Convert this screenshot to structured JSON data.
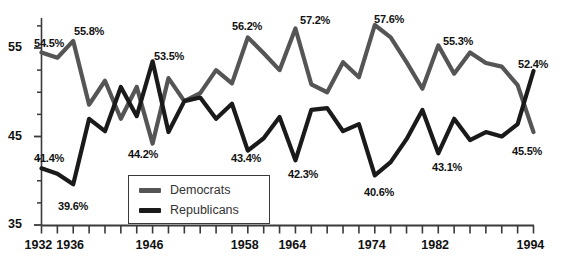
{
  "chart_data": {
    "type": "line",
    "title": "",
    "xlabel": "",
    "ylabel": "",
    "xlim": [
      1932,
      1994
    ],
    "ylim": [
      35,
      60
    ],
    "grid": false,
    "legend_position": "bottom-left",
    "y_ticks_major": [
      35,
      45,
      55
    ],
    "y_ticks_minor": [
      37.5,
      40,
      42.5,
      47.5,
      50,
      52.5,
      57.5
    ],
    "x_tick_labels": [
      "1932",
      "1936",
      "1946",
      "1958",
      "1964",
      "1974",
      "1982",
      "1994"
    ],
    "x_tick_years": [
      1932,
      1936,
      1946,
      1958,
      1964,
      1974,
      1982,
      1994
    ],
    "x_tick_step_years": 2,
    "colors": {
      "democrats": "#555555",
      "republicans": "#1a1a1a"
    },
    "series": [
      {
        "name": "Democrats",
        "color": "#555555",
        "x": [
          1932,
          1934,
          1936,
          1938,
          1940,
          1942,
          1944,
          1946,
          1948,
          1950,
          1952,
          1954,
          1956,
          1958,
          1960,
          1962,
          1964,
          1966,
          1968,
          1970,
          1972,
          1974,
          1976,
          1978,
          1980,
          1982,
          1984,
          1986,
          1988,
          1990,
          1992,
          1994
        ],
        "values": [
          54.5,
          53.9,
          55.8,
          48.6,
          51.3,
          47.0,
          50.6,
          44.2,
          51.6,
          49.0,
          49.9,
          52.5,
          51.0,
          56.2,
          54.4,
          52.5,
          57.2,
          50.9,
          50.0,
          53.4,
          51.7,
          57.6,
          56.2,
          53.4,
          50.4,
          55.3,
          52.1,
          54.5,
          53.3,
          52.9,
          50.8,
          45.5
        ]
      },
      {
        "name": "Republicans",
        "color": "#1a1a1a",
        "x": [
          1932,
          1934,
          1936,
          1938,
          1940,
          1942,
          1944,
          1946,
          1948,
          1950,
          1952,
          1954,
          1956,
          1958,
          1960,
          1962,
          1964,
          1966,
          1968,
          1970,
          1972,
          1974,
          1976,
          1978,
          1980,
          1982,
          1984,
          1986,
          1988,
          1990,
          1992,
          1994
        ],
        "values": [
          41.4,
          40.8,
          39.6,
          47.0,
          45.6,
          50.6,
          47.3,
          53.5,
          45.5,
          49.0,
          49.4,
          47.0,
          48.7,
          43.4,
          44.8,
          47.2,
          42.3,
          48.0,
          48.2,
          45.6,
          46.4,
          40.6,
          42.1,
          44.7,
          48.0,
          43.1,
          47.0,
          44.6,
          45.5,
          45.0,
          46.4,
          52.4
        ]
      }
    ],
    "annotations": [
      {
        "text": "54.5%",
        "series": "Democrats",
        "year": 1932,
        "value": 54.5,
        "x": 34,
        "y": 37
      },
      {
        "text": "55.8%",
        "series": "Democrats",
        "year": 1936,
        "value": 55.8,
        "x": 74,
        "y": 25
      },
      {
        "text": "53.5%",
        "series": "Republicans",
        "year": 1946,
        "value": 53.5,
        "x": 154,
        "y": 50
      },
      {
        "text": "56.2%",
        "series": "Democrats",
        "year": 1958,
        "value": 56.2,
        "x": 232,
        "y": 20
      },
      {
        "text": "57.2%",
        "series": "Democrats",
        "year": 1964,
        "value": 57.2,
        "x": 300,
        "y": 14
      },
      {
        "text": "57.6%",
        "series": "Democrats",
        "year": 1974,
        "value": 57.6,
        "x": 374,
        "y": 13
      },
      {
        "text": "55.3%",
        "series": "Democrats",
        "year": 1982,
        "value": 55.3,
        "x": 443,
        "y": 35
      },
      {
        "text": "52.4%",
        "series": "Republicans",
        "year": 1994,
        "value": 52.4,
        "x": 518,
        "y": 58
      },
      {
        "text": "41.4%",
        "series": "Republicans",
        "year": 1932,
        "value": 41.4,
        "x": 34,
        "y": 152
      },
      {
        "text": "39.6%",
        "series": "Republicans",
        "year": 1936,
        "value": 39.6,
        "x": 58,
        "y": 200
      },
      {
        "text": "44.2%",
        "series": "Democrats",
        "year": 1946,
        "value": 44.2,
        "x": 128,
        "y": 148
      },
      {
        "text": "43.4%",
        "series": "Republicans",
        "year": 1958,
        "value": 43.4,
        "x": 231,
        "y": 152
      },
      {
        "text": "42.3%",
        "series": "Republicans",
        "year": 1964,
        "value": 42.3,
        "x": 288,
        "y": 168
      },
      {
        "text": "40.6%",
        "series": "Republicans",
        "year": 1974,
        "value": 40.6,
        "x": 364,
        "y": 186
      },
      {
        "text": "43.1%",
        "series": "Republicans",
        "year": 1982,
        "value": 43.1,
        "x": 432,
        "y": 161
      },
      {
        "text": "45.5%",
        "series": "Democrats",
        "year": 1994,
        "value": 45.5,
        "x": 512,
        "y": 145
      }
    ]
  },
  "legend": {
    "items": [
      {
        "label": "Democrats",
        "color": "#555555"
      },
      {
        "label": "Republicans",
        "color": "#1a1a1a"
      }
    ]
  },
  "axes": {
    "y_labels": [
      "55",
      "45",
      "35"
    ],
    "x_labels": [
      "1932",
      "1936",
      "1946",
      "1958",
      "1964",
      "1974",
      "1982",
      "1994"
    ]
  }
}
